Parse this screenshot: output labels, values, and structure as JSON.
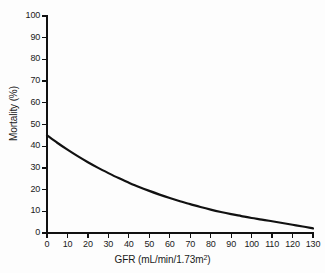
{
  "chart_data": {
    "type": "line",
    "title": "",
    "xlabel": "GFR (mL/min/1.73m2)",
    "xlabel_base": "GFR (mL/min/1.73m",
    "xlabel_sup": "2",
    "xlabel_tail": ")",
    "ylabel": "Mortality (%)",
    "xlim": [
      0,
      130
    ],
    "ylim": [
      0,
      100
    ],
    "xticks": [
      0,
      10,
      20,
      30,
      40,
      50,
      60,
      70,
      80,
      90,
      100,
      110,
      120,
      130
    ],
    "yticks": [
      0,
      10,
      20,
      30,
      40,
      50,
      60,
      70,
      80,
      90,
      100
    ],
    "grid": false,
    "legend": false,
    "series": [
      {
        "name": "Mortality vs GFR",
        "color": "#111111",
        "line_width": 2.2,
        "x": [
          0,
          5,
          10,
          15,
          20,
          25,
          30,
          35,
          40,
          45,
          50,
          55,
          60,
          65,
          70,
          75,
          80,
          85,
          90,
          95,
          100,
          105,
          110,
          115,
          120,
          125,
          130
        ],
        "values": [
          45.0,
          41.6,
          38.4,
          35.4,
          32.6,
          30.0,
          27.6,
          25.3,
          23.2,
          21.2,
          19.4,
          17.7,
          16.1,
          14.6,
          13.3,
          12.0,
          10.8,
          9.7,
          8.7,
          7.8,
          6.9,
          6.2,
          5.4,
          4.6,
          3.8,
          3.0,
          2.1
        ]
      }
    ]
  },
  "axes": {
    "y_tick_labels": [
      "100",
      "90",
      "80",
      "70",
      "60",
      "50",
      "40",
      "30",
      "20",
      "10",
      "0"
    ],
    "x_tick_labels": [
      "0",
      "10",
      "20",
      "30",
      "40",
      "50",
      "60",
      "70",
      "80",
      "90",
      "100",
      "110",
      "120",
      "130"
    ]
  },
  "colors": {
    "line": "#111111",
    "axis": "#111111",
    "text": "#1a1a1a",
    "background": "#fdfdfd"
  }
}
